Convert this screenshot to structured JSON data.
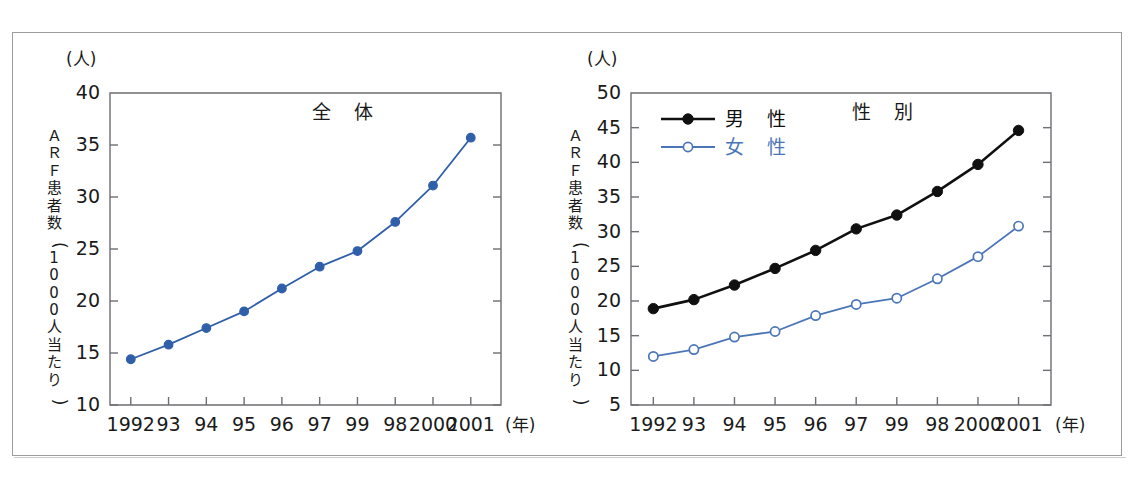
{
  "page": {
    "top_clipped_text": "",
    "bottom_clipped_text": ""
  },
  "charts": {
    "overall": {
      "unit_label": "(人)",
      "y_axis_title": "ＡＲＦ患者数（1000人当たり）",
      "y_axis_title_chars": [
        "Ａ",
        "Ｒ",
        "Ｆ",
        "患",
        "者",
        "数",
        "（",
        "1",
        "0",
        "0",
        "0",
        "人",
        "当",
        "た",
        "り",
        "）"
      ],
      "plot_title": "全　体",
      "x_unit_label": "(年)",
      "series_color": "#2f5fa8"
    },
    "sex": {
      "unit_label": "(人)",
      "y_axis_title": "ＡＲＦ患者数（1000人当たり）",
      "y_axis_title_chars": [
        "Ａ",
        "Ｒ",
        "Ｆ",
        "患",
        "者",
        "数",
        "（",
        "1",
        "0",
        "0",
        "0",
        "人",
        "当",
        "た",
        "り",
        "）"
      ],
      "plot_title": "性　別",
      "x_unit_label": "(年)",
      "legend": [
        {
          "label": "男　性",
          "color": "#101010",
          "marker": "filled-circle"
        },
        {
          "label": "女　性",
          "color": "#4a76b8",
          "marker": "open-circle"
        }
      ]
    }
  },
  "chart_data": [
    {
      "type": "line",
      "id": "overall",
      "title": "全　体",
      "xlabel": "(年)",
      "ylabel": "ＡＲＦ患者数（1000人当たり）",
      "yunit": "(人)",
      "categories": [
        "1992",
        "93",
        "94",
        "95",
        "96",
        "97",
        "99",
        "98",
        "2000",
        "2001"
      ],
      "values": [
        14.4,
        15.8,
        17.4,
        19.0,
        21.2,
        23.3,
        24.8,
        27.6,
        31.1,
        35.7
      ],
      "ylim": [
        10,
        40
      ],
      "yticks": [
        10,
        15,
        20,
        25,
        30,
        35,
        40
      ],
      "grid": false,
      "legend": null,
      "series_color": "#2f5fa8",
      "marker": "filled-diamond-circle"
    },
    {
      "type": "line",
      "id": "by-sex",
      "title": "性　別",
      "xlabel": "(年)",
      "ylabel": "ＡＲＦ患者数（1000人当たり）",
      "yunit": "(人)",
      "categories": [
        "1992",
        "93",
        "94",
        "95",
        "96",
        "97",
        "99",
        "98",
        "2000",
        "2001"
      ],
      "series": [
        {
          "name": "男　性",
          "color": "#101010",
          "marker": "filled-circle",
          "values": [
            18.9,
            20.2,
            22.3,
            24.7,
            27.3,
            30.4,
            32.4,
            35.8,
            39.7,
            44.6
          ]
        },
        {
          "name": "女　性",
          "color": "#4a76b8",
          "marker": "open-circle",
          "values": [
            12.0,
            13.0,
            14.8,
            15.6,
            17.9,
            19.5,
            20.4,
            23.2,
            26.4,
            30.8
          ]
        }
      ],
      "ylim": [
        5,
        50
      ],
      "yticks": [
        5,
        10,
        15,
        20,
        25,
        30,
        35,
        40,
        45,
        50
      ],
      "grid": false,
      "legend_position": "top-left"
    }
  ]
}
